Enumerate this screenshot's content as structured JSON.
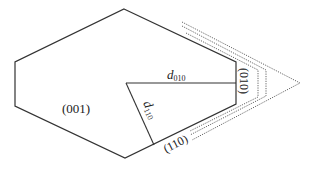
{
  "diagram": {
    "labels": {
      "face_001": "(001)",
      "face_010": "(010)",
      "face_110": "(110)",
      "d010_main": "d",
      "d010_sub": "010",
      "d110_main": "d",
      "d110_sub": "110"
    },
    "colors": {
      "outline": "#333333",
      "dotted": "#555555"
    }
  }
}
